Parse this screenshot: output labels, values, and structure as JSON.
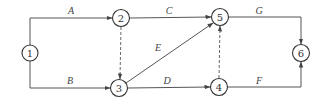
{
  "nodes": [
    {
      "id": "1",
      "label": "1",
      "cx": 30,
      "cy": 53
    },
    {
      "id": "2",
      "label": "2",
      "cx": 121,
      "cy": 18
    },
    {
      "id": "3",
      "label": "3",
      "cx": 119,
      "cy": 88
    },
    {
      "id": "4",
      "label": "4",
      "cx": 219,
      "cy": 87
    },
    {
      "id": "5",
      "label": "5",
      "cx": 220,
      "cy": 17
    },
    {
      "id": "6",
      "label": "6",
      "cx": 301,
      "cy": 53
    }
  ],
  "edges": [
    {
      "id": "A",
      "label": "A",
      "from": "1",
      "to": "2",
      "type": "activity"
    },
    {
      "id": "B",
      "label": "B",
      "from": "1",
      "to": "3",
      "type": "activity"
    },
    {
      "id": "C",
      "label": "C",
      "from": "2",
      "to": "5",
      "type": "activity"
    },
    {
      "id": "D",
      "label": "D",
      "from": "3",
      "to": "4",
      "type": "activity"
    },
    {
      "id": "E",
      "label": "E",
      "from": "3",
      "to": "5",
      "type": "activity"
    },
    {
      "id": "F",
      "label": "F",
      "from": "4",
      "to": "6",
      "type": "activity"
    },
    {
      "id": "G",
      "label": "G",
      "from": "5",
      "to": "6",
      "type": "activity"
    },
    {
      "id": "dummy-2-3",
      "label": "",
      "from": "2",
      "to": "3",
      "type": "dummy"
    },
    {
      "id": "dummy-4-5",
      "label": "",
      "from": "4",
      "to": "5",
      "type": "dummy"
    }
  ],
  "colors": {
    "line": "#555555",
    "node_stroke": "#333333",
    "text": "#444444"
  }
}
